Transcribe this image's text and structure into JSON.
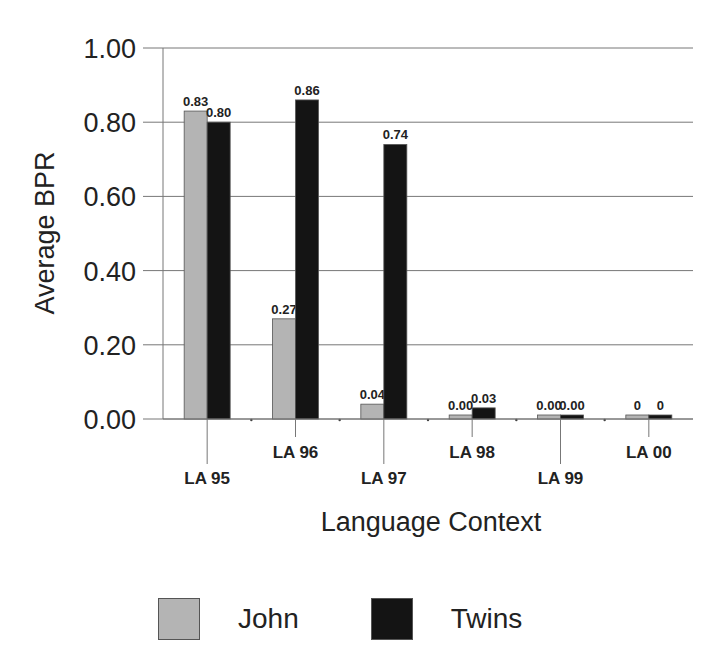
{
  "chart_data": {
    "type": "bar",
    "title": "",
    "xlabel": "Language Context",
    "ylabel": "Average BPR",
    "ylim": [
      0,
      1.0
    ],
    "yticks": [
      "0.00",
      "0.20",
      "0.40",
      "0.60",
      "0.80",
      "1.00"
    ],
    "grid": true,
    "legend_position": "bottom",
    "categories": [
      "LA 95",
      "LA 96",
      "LA 97",
      "LA 98",
      "LA 99",
      "LA 00"
    ],
    "series": [
      {
        "name": "John",
        "color": "#b4b4b4",
        "values": [
          0.83,
          0.27,
          0.04,
          0.0,
          0.0,
          0
        ],
        "labels": [
          "0.83",
          "0.27",
          "0.04",
          "0.00",
          "0.00",
          "0"
        ]
      },
      {
        "name": "Twins",
        "color": "#141414",
        "values": [
          0.8,
          0.86,
          0.74,
          0.03,
          0.0,
          0
        ],
        "labels": [
          "0.80",
          "0.86",
          "0.74",
          "0.03",
          "0.00",
          "0"
        ]
      }
    ]
  },
  "legend": {
    "items": [
      {
        "label": "John",
        "color": "#b4b4b4"
      },
      {
        "label": "Twins",
        "color": "#141414"
      }
    ]
  }
}
